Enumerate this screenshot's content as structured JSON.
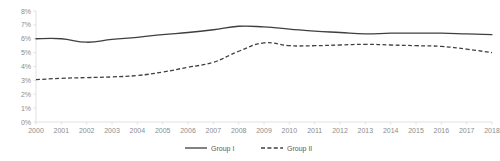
{
  "chart_data": {
    "type": "line",
    "title": "",
    "subtitle": "",
    "xlabel": "",
    "ylabel": "",
    "grid": false,
    "legend_position": "bottom",
    "ylim": [
      0,
      8
    ],
    "ytick_labels": [
      "0%",
      "1%",
      "2%",
      "3%",
      "4%",
      "5%",
      "6%",
      "7%",
      "8%"
    ],
    "ytick_values": [
      0,
      1,
      2,
      3,
      4,
      5,
      6,
      7,
      8
    ],
    "categories": [
      "2000",
      "2001",
      "2002",
      "2003",
      "2004",
      "2005",
      "2006",
      "2007",
      "2008",
      "2009",
      "2010",
      "2011",
      "2012",
      "2013",
      "2014",
      "2015",
      "2016",
      "2017",
      "2018"
    ],
    "series": [
      {
        "name": "Group I",
        "style": "solid",
        "color": "#3f3f3f",
        "values": [
          6.0,
          6.0,
          5.75,
          5.95,
          6.1,
          6.3,
          6.45,
          6.65,
          6.9,
          6.85,
          6.7,
          6.55,
          6.45,
          6.35,
          6.4,
          6.4,
          6.4,
          6.35,
          6.3
        ]
      },
      {
        "name": "Group II",
        "style": "dashed",
        "color": "#3f3f3f",
        "values": [
          3.05,
          3.15,
          3.2,
          3.25,
          3.35,
          3.6,
          3.95,
          4.3,
          5.1,
          5.7,
          5.5,
          5.5,
          5.55,
          5.6,
          5.55,
          5.5,
          5.45,
          5.25,
          5.0
        ]
      }
    ]
  },
  "legend": {
    "entries": [
      {
        "label": "Group I",
        "style": "solid"
      },
      {
        "label": "Group II",
        "style": "dashed"
      }
    ]
  }
}
